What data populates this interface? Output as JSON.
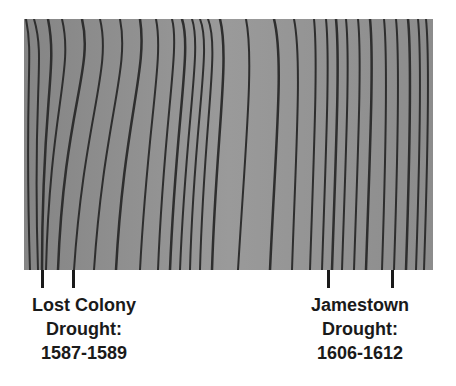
{
  "image": {
    "subject": "tree-ring cross-section (wood grain, grayscale)",
    "background_color": "#8f8f8f",
    "ring_color": "#2e2e2e"
  },
  "annotations": [
    {
      "name": "lost-colony-drought",
      "line1": "Lost Colony",
      "line2": "Drought:",
      "line3": "1587-1589",
      "tick_x": [
        42,
        73
      ]
    },
    {
      "name": "jamestown-drought",
      "line1": "Jamestown",
      "line2": "Drought:",
      "line3": "1606-1612",
      "tick_x": [
        328,
        392
      ]
    }
  ]
}
